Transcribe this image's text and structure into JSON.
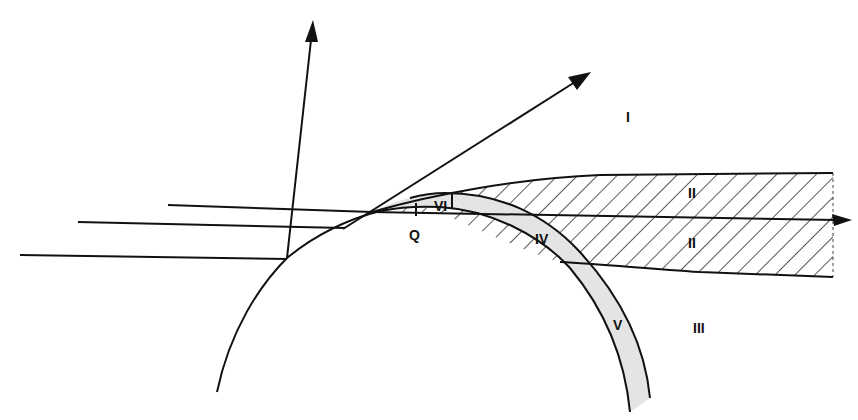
{
  "diagram": {
    "title": "",
    "colors": {
      "line": "#111111",
      "boundary_layer_fill": "#e4e4e4",
      "background": "#ffffff"
    },
    "regions": {
      "I": "I",
      "II_upper": "II",
      "II_lower": "II",
      "III": "III",
      "IV": "IV",
      "V": "V",
      "VI": "VI"
    },
    "point_labels": {
      "Q": "Q"
    },
    "elements": [
      "body-surface-arc",
      "boundary-layer-band",
      "hatched-wake-region",
      "incident-rays",
      "normal-arrow",
      "tangent-arrow",
      "axis-arrow"
    ]
  }
}
